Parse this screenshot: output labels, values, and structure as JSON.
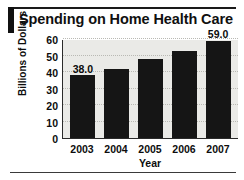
{
  "chart_data": {
    "type": "bar",
    "title": "Spending on Home Health Care",
    "xlabel": "Year",
    "ylabel": "Billions of Dollars",
    "categories": [
      "2003",
      "2004",
      "2005",
      "2006",
      "2007"
    ],
    "values": [
      38.0,
      42.0,
      48.0,
      53.0,
      59.0
    ],
    "point_labels": [
      "38.0",
      "",
      "",
      "",
      "59.0"
    ],
    "ylim": [
      0,
      60
    ],
    "yticks": [
      0,
      10,
      20,
      30,
      40,
      50,
      60
    ],
    "ytick_labels": [
      "0",
      "10",
      "20",
      "30",
      "40",
      "50",
      "60"
    ],
    "grid": true,
    "legend": false,
    "bar_color": "#151515",
    "plot_background": "#eaeae7",
    "gridline_color": "#b9b9b4",
    "text_color": "#0d0d0d"
  }
}
